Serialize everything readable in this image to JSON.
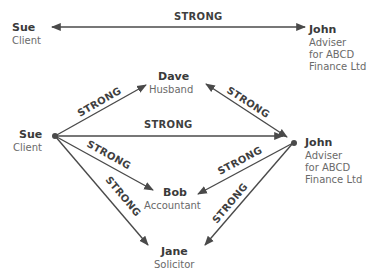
{
  "diagram": {
    "top_pair": {
      "left": {
        "name": "Sue",
        "role": "Client"
      },
      "right": {
        "name": "John",
        "role_lines": [
          "Adviser",
          "for ABCD",
          "Finance Ltd"
        ]
      },
      "relationship": "STRONG"
    },
    "network": {
      "nodes": {
        "sue": {
          "name": "Sue",
          "role": "Client"
        },
        "dave": {
          "name": "Dave",
          "role": "Husband"
        },
        "john": {
          "name": "John",
          "role_lines": [
            "Adviser",
            "for ABCD",
            "Finance Ltd"
          ]
        },
        "bob": {
          "name": "Bob",
          "role": "Accountant"
        },
        "jane": {
          "name": "Jane",
          "role": "Solicitor"
        }
      },
      "edges": [
        {
          "from": "Sue",
          "to": "Dave",
          "label": "STRONG",
          "direction": "to"
        },
        {
          "from": "Dave",
          "to": "John",
          "label": "STRONG",
          "direction": "both"
        },
        {
          "from": "Sue",
          "to": "John",
          "label": "STRONG",
          "direction": "to"
        },
        {
          "from": "Sue",
          "to": "Bob",
          "label": "STRONG",
          "direction": "to"
        },
        {
          "from": "John",
          "to": "Bob",
          "label": "STRONG",
          "direction": "to"
        },
        {
          "from": "Sue",
          "to": "Jane",
          "label": "STRONG",
          "direction": "to"
        },
        {
          "from": "John",
          "to": "Jane",
          "label": "STRONG",
          "direction": "to"
        }
      ]
    },
    "colors": {
      "line": "#4a4a4a",
      "name": "#3a3a3a",
      "role": "#6a6a6a"
    }
  }
}
